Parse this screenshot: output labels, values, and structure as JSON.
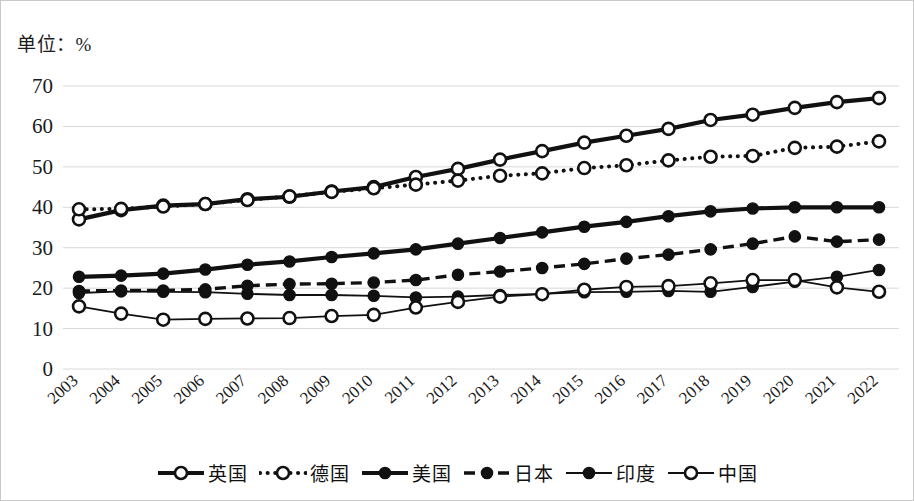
{
  "unit_label": "单位：%",
  "chart_data": {
    "type": "line",
    "title": "",
    "subtitle": "",
    "xlabel": "",
    "ylabel": "",
    "unit": "%",
    "grid": true,
    "legend_position": "bottom",
    "ylim": [
      0,
      70
    ],
    "yticks": [
      0,
      10,
      20,
      30,
      40,
      50,
      60,
      70
    ],
    "categories": [
      "2003",
      "2004",
      "2005",
      "2006",
      "2007",
      "2008",
      "2009",
      "2010",
      "2011",
      "2012",
      "2013",
      "2014",
      "2015",
      "2016",
      "2017",
      "2018",
      "2019",
      "2020",
      "2021",
      "2022"
    ],
    "series": [
      {
        "name": "英国",
        "key": "uk",
        "marker": "hollow-circle",
        "line": "thick-solid",
        "values": [
          37.0,
          39.3,
          40.4,
          40.8,
          42.0,
          42.6,
          43.9,
          45.0,
          47.5,
          49.5,
          51.8,
          53.9,
          56.0,
          57.7,
          59.4,
          61.6,
          62.9,
          64.6,
          66.0,
          67.0
        ]
      },
      {
        "name": "德国",
        "key": "germany",
        "marker": "hollow-circle",
        "line": "dotted",
        "values": [
          39.5,
          39.6,
          40.2,
          40.8,
          41.8,
          42.7,
          43.8,
          44.7,
          45.6,
          46.6,
          47.8,
          48.4,
          49.7,
          50.4,
          51.6,
          52.5,
          52.7,
          54.7,
          55.0,
          56.3
        ]
      },
      {
        "name": "美国",
        "key": "usa",
        "marker": "solid-circle",
        "line": "thick-solid",
        "values": [
          22.8,
          23.1,
          23.6,
          24.6,
          25.8,
          26.6,
          27.7,
          28.6,
          29.6,
          31.0,
          32.4,
          33.8,
          35.2,
          36.4,
          37.8,
          39.0,
          39.7,
          40.0,
          40.0,
          40.0
        ]
      },
      {
        "name": "日本",
        "key": "japan",
        "marker": "solid-circle",
        "line": "dashed",
        "values": [
          19.3,
          19.4,
          19.4,
          19.7,
          20.6,
          21.0,
          21.1,
          21.4,
          22.0,
          23.3,
          24.1,
          25.0,
          26.0,
          27.3,
          28.3,
          29.6,
          31.0,
          32.8,
          31.5,
          32.0
        ]
      },
      {
        "name": "印度",
        "key": "india",
        "marker": "solid-circle",
        "line": "thin-solid",
        "values": [
          18.8,
          19.2,
          19.1,
          19.0,
          18.6,
          18.3,
          18.3,
          18.1,
          17.7,
          17.9,
          18.3,
          18.6,
          19.0,
          19.1,
          19.3,
          19.1,
          20.3,
          21.6,
          22.8,
          24.5
        ]
      },
      {
        "name": "中国",
        "key": "china",
        "marker": "hollow-circle",
        "line": "thin-solid",
        "values": [
          15.5,
          13.7,
          12.2,
          12.4,
          12.5,
          12.6,
          13.1,
          13.4,
          15.2,
          16.6,
          17.9,
          18.5,
          19.6,
          20.3,
          20.5,
          21.2,
          22.0,
          22.0,
          20.2,
          19.1
        ]
      }
    ]
  },
  "legend": [
    {
      "label": "英国",
      "style": "thick-solid-hollow"
    },
    {
      "label": "德国",
      "style": "dotted-hollow"
    },
    {
      "label": "美国",
      "style": "thick-solid-filled"
    },
    {
      "label": "日本",
      "style": "dashed-filled"
    },
    {
      "label": "印度",
      "style": "thin-solid-filled"
    },
    {
      "label": "中国",
      "style": "thin-solid-hollow"
    }
  ],
  "colors": {
    "line": "#111111",
    "grid": "#d8d8d8",
    "text": "#1b1b1b",
    "border": "#c9c9c9",
    "background": "#ffffff"
  }
}
